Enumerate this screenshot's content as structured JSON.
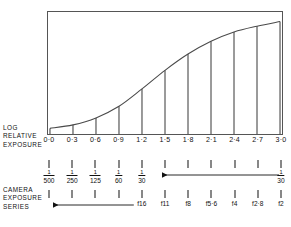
{
  "figure": {
    "caption_bottom": ""
  },
  "axis": {
    "title_lines": [
      "LOG",
      "RELATIVE",
      "EXPOSURE"
    ],
    "tick_labels": [
      "0·0",
      "0·3",
      "0·6",
      "0·9",
      "1·2",
      "1·5",
      "1·8",
      "2·1",
      "2·4",
      "2·7",
      "3·0"
    ]
  },
  "camera": {
    "title_lines": [
      "CAMERA",
      "EXPOSURE",
      "SERIES"
    ]
  },
  "shutter_scale": {
    "name": "shutter-speed-scale",
    "values": [
      {
        "num": "1",
        "den": "500"
      },
      {
        "num": "1",
        "den": "250"
      },
      {
        "num": "1",
        "den": "125"
      },
      {
        "num": "1",
        "den": "60"
      },
      {
        "num": "1",
        "den": "30"
      },
      {
        "num": "1",
        "den": "30"
      }
    ],
    "value_positions": [
      0,
      1,
      2,
      3,
      4,
      10
    ],
    "arrow": {
      "from_index": 10,
      "to_index": 5,
      "direction": "left"
    }
  },
  "fstop_scale": {
    "name": "aperture-scale",
    "values": [
      "f16",
      "f11",
      "f8",
      "f5·6",
      "f4",
      "f2·8",
      "f2"
    ],
    "value_positions": [
      4,
      5,
      6,
      7,
      8,
      9,
      10
    ],
    "arrow": {
      "from_index": 4,
      "to_index": 0,
      "direction": "left"
    }
  },
  "chart_data": {
    "type": "line",
    "title": "",
    "xlabel": "LOG RELATIVE EXPOSURE",
    "ylabel": "",
    "xlim": [
      0.0,
      3.0
    ],
    "ylim": [
      0,
      100
    ],
    "grid": false,
    "legend": "none",
    "x": [
      0.0,
      0.3,
      0.6,
      0.9,
      1.2,
      1.5,
      1.8,
      2.1,
      2.4,
      2.7,
      3.0
    ],
    "curve_name": "characteristic-curve",
    "values": [
      4,
      7,
      13,
      23,
      38,
      54,
      68,
      79,
      87,
      92,
      96
    ],
    "bars": {
      "name": "exposure-step-lines",
      "x": [
        0.0,
        0.3,
        0.6,
        0.9,
        1.2,
        1.5,
        1.8,
        2.1,
        2.4,
        2.7,
        3.0
      ],
      "heights": [
        4,
        7,
        13,
        23,
        38,
        54,
        68,
        79,
        87,
        92,
        96
      ]
    },
    "annotations": [
      {
        "text": "0·0",
        "x": 0.0
      },
      {
        "text": "0·3",
        "x": 0.3
      },
      {
        "text": "0·6",
        "x": 0.6
      },
      {
        "text": "0·9",
        "x": 0.9
      },
      {
        "text": "1·2",
        "x": 1.2
      },
      {
        "text": "1·5",
        "x": 1.5
      },
      {
        "text": "1·8",
        "x": 1.8
      },
      {
        "text": "2·1",
        "x": 2.1
      },
      {
        "text": "2·4",
        "x": 2.4
      },
      {
        "text": "2·7",
        "x": 2.7
      },
      {
        "text": "3·0",
        "x": 3.0
      }
    ]
  }
}
